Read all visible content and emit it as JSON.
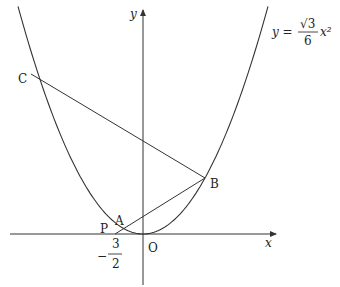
{
  "figure": {
    "curve_equation": {
      "lhs": "y =",
      "numerator": "√3",
      "denominator": "6",
      "rhs": "x²",
      "text": "y = (√3/6) x²"
    },
    "axes": {
      "x_label": "x",
      "y_label": "y",
      "origin_label": "O"
    },
    "points": {
      "A": "A",
      "B": "B",
      "C": "C",
      "P": "P"
    },
    "tick_label": {
      "sign": "−",
      "numerator": "3",
      "denominator": "2",
      "value": "-3/2"
    },
    "segments": [
      "CB",
      "PB",
      "PC"
    ],
    "colors": {
      "stroke": "#333333",
      "text": "#222222",
      "background": "#ffffff"
    }
  }
}
